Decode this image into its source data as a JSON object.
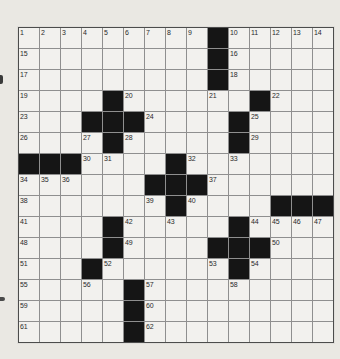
{
  "page": {
    "background_color": "#eae8e3"
  },
  "crossword": {
    "rows": 15,
    "cols": 15,
    "colors": {
      "black_cell": "#151515",
      "white_cell": "#f2f1ee",
      "grid_line": "#8f8f8f",
      "outer_border": "#4c4c4c",
      "number_color": "#2a2a2a"
    },
    "cells": [
      [
        "1",
        "2",
        "3",
        "4",
        "5",
        "6",
        "7",
        "8",
        "9",
        "#",
        "10",
        "11",
        "12",
        "13",
        "14"
      ],
      [
        "15",
        "",
        "",
        "",
        "",
        "",
        "",
        "",
        "",
        "#",
        "16",
        "",
        "",
        "",
        ""
      ],
      [
        "17",
        "",
        "",
        "",
        "",
        "",
        "",
        "",
        "",
        "#",
        "18",
        "",
        "",
        "",
        ""
      ],
      [
        "19",
        "",
        "",
        "",
        "#",
        "20",
        "",
        "",
        "",
        "21",
        "",
        "#",
        "22",
        "",
        ""
      ],
      [
        "23",
        "",
        "",
        "#",
        "#",
        "#",
        "24",
        "",
        "",
        "",
        "#",
        "25",
        "",
        "",
        ""
      ],
      [
        "26",
        "",
        "",
        "27",
        "#",
        "28",
        "",
        "",
        "",
        "",
        "#",
        "29",
        "",
        "",
        ""
      ],
      [
        "#",
        "#",
        "#",
        "30",
        "31",
        "",
        "",
        "#",
        "32",
        "",
        "33",
        "",
        "",
        "",
        ""
      ],
      [
        "34",
        "35",
        "36",
        "",
        "",
        "",
        "#",
        "#",
        "#",
        "37",
        "",
        "",
        "",
        "",
        ""
      ],
      [
        "38",
        "",
        "",
        "",
        "",
        "",
        "39",
        "#",
        "40",
        "",
        "",
        "",
        "#",
        "#",
        "#"
      ],
      [
        "41",
        "",
        "",
        "",
        "#",
        "42",
        "",
        "43",
        "",
        "",
        "#",
        "44",
        "45",
        "46",
        "47"
      ],
      [
        "48",
        "",
        "",
        "",
        "#",
        "49",
        "",
        "",
        "",
        "#",
        "#",
        "#",
        "50",
        "",
        ""
      ],
      [
        "51",
        "",
        "",
        "#",
        "52",
        "",
        "",
        "",
        "",
        "53",
        "#",
        "54",
        "",
        "",
        ""
      ],
      [
        "55",
        "",
        "",
        "56",
        "",
        "#",
        "57",
        "",
        "",
        "",
        "58",
        "",
        "",
        "",
        ""
      ],
      [
        "59",
        "",
        "",
        "",
        "",
        "#",
        "60",
        "",
        "",
        "",
        "",
        "",
        "",
        "",
        ""
      ],
      [
        "61",
        "",
        "",
        "",
        "",
        "#",
        "62",
        "",
        "",
        "",
        "",
        "",
        "",
        "",
        ""
      ]
    ]
  }
}
